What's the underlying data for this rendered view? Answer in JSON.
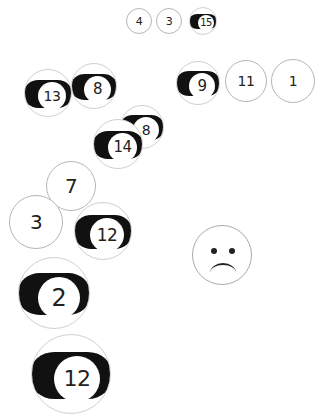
{
  "balls": [
    {
      "id": "ball-4-top",
      "number": "4",
      "style": "solid",
      "x": 126,
      "y": 8,
      "r": 13,
      "fs": 11
    },
    {
      "id": "ball-3-top",
      "number": "3",
      "style": "solid",
      "x": 156,
      "y": 8,
      "r": 13,
      "fs": 11
    },
    {
      "id": "ball-15-top",
      "number": "15",
      "style": "stripe",
      "x": 189,
      "y": 7,
      "r": 14,
      "fs": 10
    },
    {
      "id": "ball-13",
      "number": "13",
      "style": "stripe",
      "x": 24,
      "y": 69,
      "r": 24,
      "fs": 14
    },
    {
      "id": "ball-8",
      "number": "8",
      "style": "stripe",
      "x": 71,
      "y": 63,
      "r": 23,
      "fs": 15
    },
    {
      "id": "ball-9",
      "number": "9",
      "style": "stripe",
      "x": 176,
      "y": 61,
      "r": 22,
      "fs": 15
    },
    {
      "id": "ball-11",
      "number": "11",
      "style": "solid",
      "x": 225,
      "y": 60,
      "r": 21,
      "fs": 14
    },
    {
      "id": "ball-1",
      "number": "1",
      "style": "solid",
      "x": 271,
      "y": 59,
      "r": 22,
      "fs": 14
    },
    {
      "id": "ball-8-hidden",
      "number": "8",
      "style": "stripe",
      "x": 120,
      "y": 105,
      "r": 22,
      "fs": 14
    },
    {
      "id": "ball-14",
      "number": "14",
      "style": "stripe",
      "x": 93,
      "y": 119,
      "r": 25,
      "fs": 15
    },
    {
      "id": "ball-7",
      "number": "7",
      "style": "solid",
      "x": 46,
      "y": 161,
      "r": 25,
      "fs": 20
    },
    {
      "id": "ball-3-large",
      "number": "3",
      "style": "solid",
      "x": 9,
      "y": 195,
      "r": 27,
      "fs": 20
    },
    {
      "id": "ball-12-mid",
      "number": "12",
      "style": "stripe",
      "x": 74,
      "y": 202,
      "r": 29,
      "fs": 17
    },
    {
      "id": "ball-2",
      "number": "2",
      "style": "stripe",
      "x": 18,
      "y": 257,
      "r": 36,
      "fs": 24
    },
    {
      "id": "ball-12-bottom",
      "number": "12",
      "style": "stripe",
      "x": 31,
      "y": 334,
      "r": 40,
      "fs": 22
    }
  ],
  "smiley": {
    "id": "sad-face",
    "expression": "sad",
    "x": 192,
    "y": 225,
    "r": 30
  }
}
